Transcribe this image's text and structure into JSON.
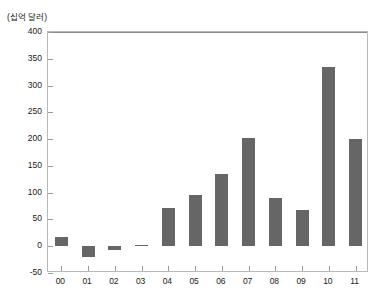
{
  "unit_label": "(십억 달러)",
  "chart_data": {
    "type": "bar",
    "title": "",
    "subtitle": "",
    "xlabel": "",
    "ylabel": "(십억 달러)",
    "categories": [
      "00",
      "01",
      "02",
      "03",
      "04",
      "05",
      "06",
      "07",
      "08",
      "09",
      "10",
      "11"
    ],
    "values": [
      18,
      -20,
      -7,
      3,
      72,
      95,
      135,
      202,
      90,
      67,
      335,
      201
    ],
    "series": [
      {
        "name": "",
        "values": [
          18,
          -20,
          -7,
          3,
          72,
          95,
          135,
          202,
          90,
          67,
          335,
          201
        ]
      }
    ],
    "ylim": [
      -50,
      400
    ],
    "ytick_values": [
      400,
      350,
      300,
      250,
      200,
      150,
      100,
      50,
      0,
      -50
    ],
    "ytick_labels": [
      "400",
      "350",
      "300",
      "250",
      "200",
      "150",
      "100",
      "50",
      "0",
      "-50"
    ],
    "grid": false,
    "legend": false,
    "legend_position": "none",
    "bar_color": "#666666",
    "axis_color": "#b9b9b9",
    "zero_line": 0
  }
}
